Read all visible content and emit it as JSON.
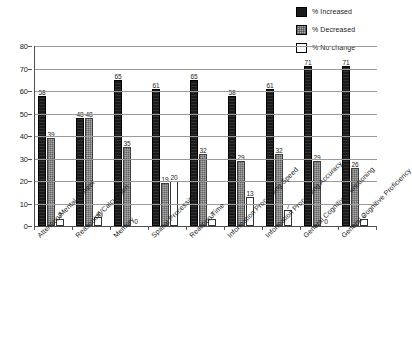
{
  "chart_data": {
    "type": "bar",
    "title": "",
    "xlabel": "",
    "ylabel": "",
    "ylim": [
      0,
      80
    ],
    "yticks": [
      0,
      10,
      20,
      30,
      40,
      50,
      60,
      70,
      80
    ],
    "grid": true,
    "legend_position": "top-right",
    "categories": [
      "Attention/Mental Control",
      "Reasoning/Calculation",
      "Memory",
      "Spatial Processing",
      "Reaction Time",
      "Information Processing Speed",
      "Information Processing Accuracy",
      "General Cognitive Functioning",
      "General Cognitive Proficiency"
    ],
    "series": [
      {
        "name": "% Increased",
        "color": "#1a1a1a",
        "values": [
          58,
          48,
          65,
          61,
          65,
          58,
          61,
          71,
          71
        ]
      },
      {
        "name": "% Decreased",
        "color": "#a9a9a9",
        "values": [
          39,
          48,
          35,
          19,
          32,
          29,
          32,
          29,
          26
        ]
      },
      {
        "name": "% No change",
        "color": "#ffffff",
        "values": [
          3,
          4,
          0,
          20,
          3,
          13,
          7,
          0,
          3
        ]
      }
    ]
  },
  "legend": {
    "items": [
      {
        "label": "% Increased",
        "swatch": "legend-swatch-increased"
      },
      {
        "label": "% Decreased",
        "swatch": "legend-swatch-decreased"
      },
      {
        "label": "% No change",
        "swatch": "legend-swatch-nochange"
      }
    ]
  },
  "axis": {
    "y_tick_labels": [
      "80",
      "70",
      "60",
      "50",
      "40",
      "30",
      "20",
      "10",
      "0"
    ]
  }
}
